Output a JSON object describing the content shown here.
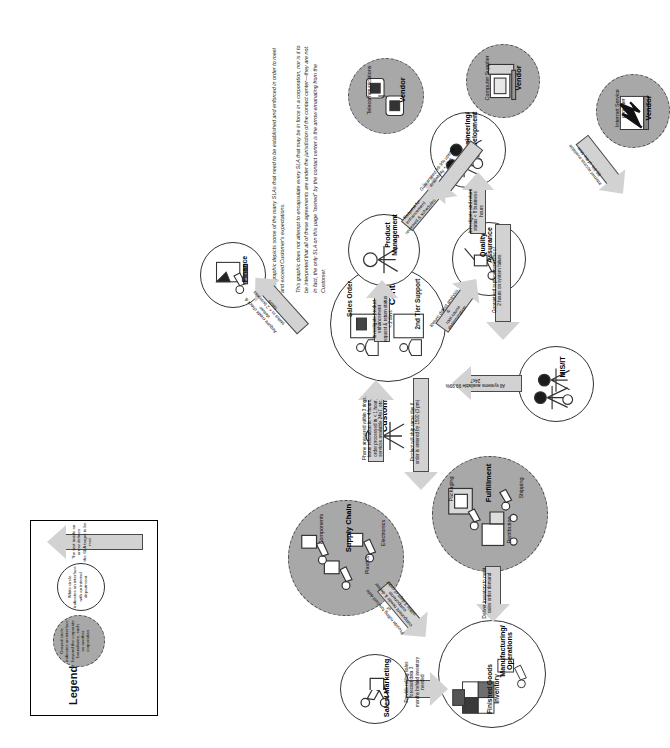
{
  "diagram": {
    "blurb": "This graphic depicts some of the many SLAs that need to be established and enforced in order to meet  and exceed Customer's expectations.\n\nThis graphic does not attempt  to encapsulate every SLA  that may be in force in a corporation, nor is it to be interpreted that all of these agreements are under the jurisdiction of the contact center—they are not. In fact, the only SLA on this page \"owned\" by the contact center is the arrow emanating from the Customer."
  },
  "legend": {
    "title": "Legend",
    "gray_circle_text": "Grayed circle\nindicates an interface\nbeyond the corporate\nboundaries, such\nas another\ncorporation",
    "white_circle_text": "White circle\nindicates an interface\nwith an internal\ndepartment",
    "arrow_text": "The text inside an arrow defines\nthe SLA target to be met"
  },
  "nodes": [
    {
      "id": "sales-marketing",
      "label": "Sales/\nMarketing",
      "type": "white"
    },
    {
      "id": "supply-chain",
      "label": "Supply\nChain",
      "type": "gray",
      "sublabels": [
        "Plastics",
        "Components",
        "Electronics"
      ]
    },
    {
      "id": "manufacturing",
      "label": "Manufacturing/\nOperations",
      "type": "white",
      "sublabels": [
        "Finished Goods\nInventory"
      ]
    },
    {
      "id": "fulfillment",
      "label": "Fulfillment",
      "type": "gray",
      "sublabels": [
        "Packaging",
        "Distribution",
        "Shipping"
      ]
    },
    {
      "id": "customer",
      "label": "Customer",
      "type": "none"
    },
    {
      "id": "contact-center",
      "label": "Contact\nCenter",
      "type": "white",
      "sublabels": [
        "Sales Order",
        "2nd Tier\nSupport"
      ]
    },
    {
      "id": "finance",
      "label": "Finance",
      "type": "white"
    },
    {
      "id": "product-management",
      "label": "Product\nManagement",
      "type": "white"
    },
    {
      "id": "quality-assurance",
      "label": "Quality\nAssurance",
      "type": "white"
    },
    {
      "id": "engineering",
      "label": "Engineering/\nDevelopment",
      "type": "white"
    },
    {
      "id": "mis-it",
      "label": "MIS/IT",
      "type": "white"
    },
    {
      "id": "isp-vendor",
      "label": "Vendor",
      "type": "gray",
      "sublabels": [
        "Internet Service\nprovider"
      ]
    },
    {
      "id": "computer-vendor",
      "label": "Vendor",
      "type": "gray",
      "sublabels": [
        "Computer Supplier"
      ]
    },
    {
      "id": "telecom-vendor",
      "label": "Vendor",
      "type": "gray",
      "sublabels": [
        "Telecommunications"
      ]
    }
  ],
  "arrows": [
    {
      "id": "sales-to-manufacturing",
      "text": "Provide rolling sales forecast data 3\nmonths behind inventory needed"
    },
    {
      "id": "supply-to-manufacturing",
      "text": "Provide rolling forecast data of\ncomponent needs & deliver components\nwithin 3 days of order"
    },
    {
      "id": "fulfillment-to-manufacturing",
      "text": "Deliver inventory to meet\nsales order demand"
    },
    {
      "id": "contact-to-fulfillment",
      "text": "Product will ship same day if\norder is entered by 1500 (3 pm)"
    },
    {
      "id": "contact-to-finance",
      "text": "Acquire credit check & deliver\nstatus in < 2 business hours"
    },
    {
      "id": "customer-to-contact",
      "text": "Phone answered within 3 rings,\nissue resolution in < 4 hours,\norder processed in < 1 hour,\nservices available 24x7, etc."
    },
    {
      "id": "contact-to-product",
      "text": "Investigate product enhancement\nrequest & return status < 2 days"
    },
    {
      "id": "product-to-engineering",
      "text": "Request for enhancement\nreviewed & scheduled"
    },
    {
      "id": "contact-to-quality",
      "text": "Return defect analysis &\nroot cause determination"
    },
    {
      "id": "quality-to-engineering",
      "text": "Investigate and return\nstatus < 8 business hours"
    },
    {
      "id": "mis-to-contact",
      "text": "All systems available 99.99% 24x7"
    },
    {
      "id": "isp-to-mis",
      "text": "Internet access available\n99.9% of the time"
    },
    {
      "id": "computer-to-mis",
      "text": "Guaranteed replacement time of\n2 hours on system failure"
    },
    {
      "id": "telecom-to-mis",
      "text": "Guaranteed 99.9% uptime\navailability + QoS"
    }
  ]
}
